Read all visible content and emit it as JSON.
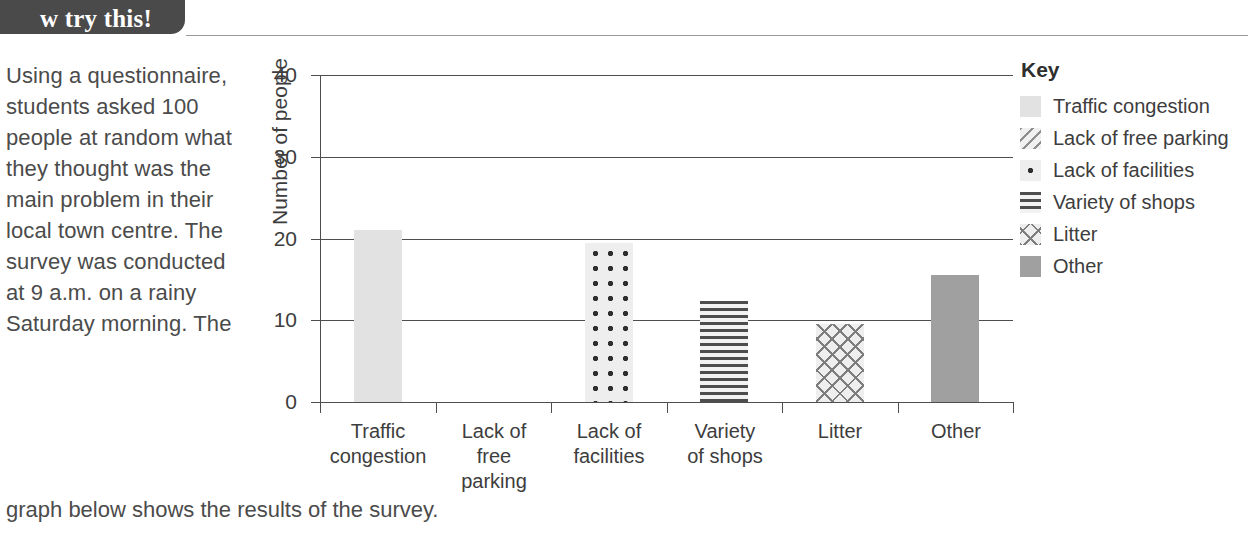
{
  "header": {
    "tab_label": "w try this!"
  },
  "prose": {
    "body": "Using a questionnaire, students asked 100 people at random what they thought was the main problem in their local town centre. The survey was conducted at 9 a.m. on a rainy Saturday morning. The",
    "tail": "graph below shows the results of the survey."
  },
  "key": {
    "title": "Key",
    "items": [
      {
        "label": "Traffic congestion",
        "pattern": "solid-light"
      },
      {
        "label": "Lack of free parking",
        "pattern": "diagonal-lines"
      },
      {
        "label": "Lack of facilities",
        "pattern": "dots"
      },
      {
        "label": "Variety of shops",
        "pattern": "horizontal-lines"
      },
      {
        "label": "Litter",
        "pattern": "crosshatch"
      },
      {
        "label": "Other",
        "pattern": "solid-gray"
      }
    ]
  },
  "chart_data": {
    "type": "bar",
    "title": "",
    "xlabel": "",
    "ylabel": "Number of people",
    "ylim": [
      0,
      40
    ],
    "yticks": [
      0,
      10,
      20,
      30,
      40
    ],
    "grid": true,
    "legend_position": "right",
    "categories": [
      "Traffic congestion",
      "Lack of free parking",
      "Lack of facilities",
      "Variety of shops",
      "Litter",
      "Other"
    ],
    "category_lines": [
      [
        "Traffic",
        "congestion"
      ],
      [
        "Lack of",
        "free",
        "parking"
      ],
      [
        "Lack of",
        "facilities"
      ],
      [
        "Variety",
        "of shops"
      ],
      [
        "Litter"
      ],
      [
        "Other"
      ]
    ],
    "values": [
      21,
      0,
      19.5,
      12.3,
      9.5,
      15.5
    ],
    "fills": [
      "solid-light",
      "diagonal-lines",
      "dots",
      "horizontal-lines",
      "crosshatch",
      "solid-gray"
    ],
    "colors": {
      "solid-light": "#e2e2e2",
      "solid-gray": "#a0a0a0",
      "axis": "#4e4e4e"
    }
  }
}
